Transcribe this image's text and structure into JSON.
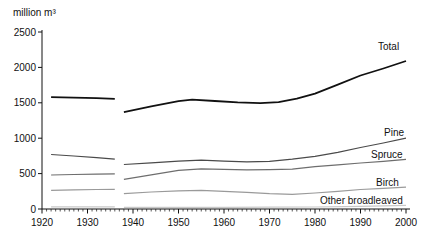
{
  "chart_data": {
    "type": "line",
    "title": "",
    "unit_label": "million m³",
    "xlabel": "",
    "ylabel": "million m³",
    "xlim": [
      1920,
      2000
    ],
    "ylim": [
      0,
      2500
    ],
    "grid": false,
    "legend_position": "end-of-line-labels",
    "y_ticks": [
      0,
      500,
      1000,
      1500,
      2000,
      2500
    ],
    "x_major_ticks": [
      1920,
      1930,
      1940,
      1950,
      1960,
      1970,
      1980,
      1990,
      2000
    ],
    "x_minor_tick_step": 1,
    "note": "All series have a data gap between 1936 and 1938",
    "series": [
      {
        "name": "total",
        "label": "Total",
        "color": "#111111",
        "stroke_width": 1.8,
        "label_pos": {
          "x": 378,
          "y": 50
        },
        "segments": [
          [
            [
              1922,
              1580
            ],
            [
              1927,
              1573
            ],
            [
              1932,
              1565
            ],
            [
              1936,
              1556
            ]
          ],
          [
            [
              1938,
              1368
            ],
            [
              1944,
              1450
            ],
            [
              1950,
              1523
            ],
            [
              1953,
              1545
            ],
            [
              1958,
              1525
            ],
            [
              1963,
              1505
            ],
            [
              1968,
              1495
            ],
            [
              1972,
              1510
            ],
            [
              1976,
              1560
            ],
            [
              1980,
              1630
            ],
            [
              1985,
              1755
            ],
            [
              1990,
              1885
            ],
            [
              1995,
              1985
            ],
            [
              2000,
              2090
            ]
          ]
        ]
      },
      {
        "name": "pine",
        "label": "Pine",
        "color": "#4a4a4a",
        "stroke_width": 1.2,
        "label_pos": {
          "x": 384,
          "y": 136
        },
        "segments": [
          [
            [
              1922,
              770
            ],
            [
              1927,
              748
            ],
            [
              1932,
              725
            ],
            [
              1936,
              703
            ]
          ],
          [
            [
              1938,
              628
            ],
            [
              1944,
              652
            ],
            [
              1950,
              675
            ],
            [
              1955,
              690
            ],
            [
              1960,
              676
            ],
            [
              1965,
              665
            ],
            [
              1970,
              672
            ],
            [
              1975,
              705
            ],
            [
              1980,
              745
            ],
            [
              1985,
              800
            ],
            [
              1990,
              868
            ],
            [
              1995,
              932
            ],
            [
              2000,
              1000
            ]
          ]
        ]
      },
      {
        "name": "spruce",
        "label": "Spruce",
        "color": "#6e6e6e",
        "stroke_width": 1.2,
        "label_pos": {
          "x": 371,
          "y": 158
        },
        "segments": [
          [
            [
              1922,
              480
            ],
            [
              1927,
              487
            ],
            [
              1932,
              492
            ],
            [
              1936,
              497
            ]
          ],
          [
            [
              1938,
              420
            ],
            [
              1944,
              482
            ],
            [
              1950,
              545
            ],
            [
              1955,
              568
            ],
            [
              1960,
              560
            ],
            [
              1965,
              554
            ],
            [
              1970,
              556
            ],
            [
              1975,
              562
            ],
            [
              1980,
              598
            ],
            [
              1985,
              624
            ],
            [
              1990,
              650
            ],
            [
              1995,
              674
            ],
            [
              2000,
              700
            ]
          ]
        ]
      },
      {
        "name": "birch",
        "label": "Birch",
        "color": "#9a9a9a",
        "stroke_width": 1.2,
        "label_pos": {
          "x": 376,
          "y": 186
        },
        "segments": [
          [
            [
              1922,
              264
            ],
            [
              1927,
              270
            ],
            [
              1932,
              275
            ],
            [
              1936,
              278
            ]
          ],
          [
            [
              1938,
              216
            ],
            [
              1944,
              240
            ],
            [
              1950,
              256
            ],
            [
              1955,
              264
            ],
            [
              1960,
              250
            ],
            [
              1965,
              234
            ],
            [
              1970,
              216
            ],
            [
              1975,
              208
            ],
            [
              1980,
              226
            ],
            [
              1985,
              250
            ],
            [
              1990,
              275
            ],
            [
              1995,
              293
            ],
            [
              2000,
              310
            ]
          ]
        ]
      },
      {
        "name": "other-broadleaved",
        "label": "Other broadleaved",
        "color": "#c8c8c8",
        "stroke_width": 1.2,
        "label_pos": {
          "x": 320,
          "y": 204
        },
        "segments": [
          [
            [
              1922,
              30
            ],
            [
              1936,
              30
            ]
          ],
          [
            [
              1938,
              22
            ],
            [
              1950,
              24
            ],
            [
              1960,
              24
            ],
            [
              1970,
              25
            ],
            [
              1980,
              28
            ],
            [
              1990,
              38
            ],
            [
              2000,
              52
            ]
          ]
        ]
      }
    ],
    "layout": {
      "width": 424,
      "height": 241,
      "plot_left": 42,
      "plot_right": 406,
      "plot_top": 32,
      "plot_bottom": 209,
      "axis_right_end": 410,
      "axis_top_end": 30,
      "major_tick_len": 4.5,
      "minor_tick_len": 2.5,
      "y_tick_len": 4,
      "tick_label_font": 10,
      "series_label_font": 10,
      "unit_label_font": 10,
      "axis_color": "#111111",
      "label_color": "#111111"
    }
  }
}
